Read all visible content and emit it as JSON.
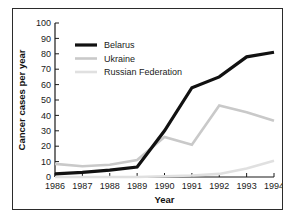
{
  "chart_data": {
    "type": "line",
    "title": "",
    "xlabel": "Year",
    "ylabel": "Cancer cases per year",
    "categories": [
      "1986",
      "1987",
      "1988",
      "1989",
      "1990",
      "1991",
      "1992",
      "1993",
      "1994"
    ],
    "x": [
      1986,
      1987,
      1988,
      1989,
      1990,
      1991,
      1992,
      1993,
      1994
    ],
    "xlim": [
      1986,
      1994
    ],
    "ylim": [
      0,
      100
    ],
    "yticks": [
      0,
      10,
      20,
      30,
      40,
      50,
      60,
      70,
      80,
      90,
      100
    ],
    "xticks": [
      "1986",
      "1987",
      "1988",
      "1989",
      "1990",
      "1991",
      "1992",
      "1993",
      "1994"
    ],
    "grid": false,
    "legend_position": "upper-left",
    "series": [
      {
        "name": "Belarus",
        "color": "#111111",
        "width": 3.2,
        "values": [
          2,
          3,
          4.5,
          6.5,
          30,
          58,
          65,
          78,
          81
        ]
      },
      {
        "name": "Ukraine",
        "color": "#c9c9c9",
        "width": 2.6,
        "values": [
          8.5,
          7,
          8,
          11,
          26,
          21,
          46.5,
          42,
          36.5
        ]
      },
      {
        "name": "Russian Federation",
        "color": "#e0e0e0",
        "width": 2.6,
        "values": [
          0,
          0,
          0,
          0,
          0.5,
          1,
          2,
          5.5,
          10.5
        ]
      }
    ]
  },
  "axis": {
    "y_title": "Cancer cases per year",
    "x_title": "Year",
    "y_tick_labels": [
      "100",
      "90",
      "80",
      "70",
      "60",
      "50",
      "40",
      "30",
      "20",
      "10",
      "0"
    ],
    "x_tick_labels": [
      "1986",
      "1987",
      "1988",
      "1989",
      "1990",
      "1991",
      "1992",
      "1993",
      "1994"
    ]
  },
  "legend": {
    "entries": [
      {
        "label": "Belarus"
      },
      {
        "label": "Ukraine"
      },
      {
        "label": "Russian Federation"
      }
    ]
  }
}
